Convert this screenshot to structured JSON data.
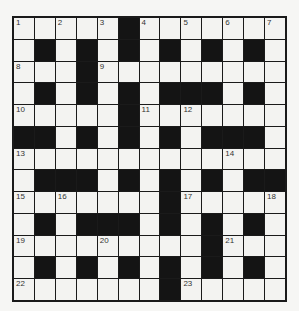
{
  "puzzle": {
    "rows": 13,
    "cols": 13,
    "pattern": [
      "WWWWWBWWWWWWW",
      "WBWBWBWBWBWBW",
      "WWWBWWWWWWWWW",
      "WBWBWBWBBBWBW",
      "WWWWWBWWWWWWW",
      "BBWBWBWBWBBBW",
      "WWWWWWWWWWWWW",
      "WBBBWBWBWBWBB",
      "WWWWWWWBWWWWW",
      "WBWBBBWBWBWBW",
      "WWWWWWWWWBWWW",
      "WBWBWBWBWBWBW",
      "WWWWWWWBWWWWW"
    ],
    "numbers": [
      {
        "r": 0,
        "c": 0,
        "n": "1"
      },
      {
        "r": 0,
        "c": 2,
        "n": "2"
      },
      {
        "r": 0,
        "c": 4,
        "n": "3"
      },
      {
        "r": 0,
        "c": 6,
        "n": "4"
      },
      {
        "r": 0,
        "c": 8,
        "n": "5"
      },
      {
        "r": 0,
        "c": 10,
        "n": "6"
      },
      {
        "r": 0,
        "c": 12,
        "n": "7"
      },
      {
        "r": 2,
        "c": 0,
        "n": "8"
      },
      {
        "r": 2,
        "c": 4,
        "n": "9"
      },
      {
        "r": 4,
        "c": 0,
        "n": "10"
      },
      {
        "r": 4,
        "c": 6,
        "n": "11"
      },
      {
        "r": 4,
        "c": 8,
        "n": "12"
      },
      {
        "r": 6,
        "c": 0,
        "n": "13"
      },
      {
        "r": 6,
        "c": 10,
        "n": "14"
      },
      {
        "r": 8,
        "c": 0,
        "n": "15"
      },
      {
        "r": 8,
        "c": 2,
        "n": "16"
      },
      {
        "r": 8,
        "c": 8,
        "n": "17"
      },
      {
        "r": 8,
        "c": 12,
        "n": "18"
      },
      {
        "r": 10,
        "c": 0,
        "n": "19"
      },
      {
        "r": 10,
        "c": 4,
        "n": "20"
      },
      {
        "r": 10,
        "c": 10,
        "n": "21"
      },
      {
        "r": 12,
        "c": 0,
        "n": "22"
      },
      {
        "r": 12,
        "c": 8,
        "n": "23"
      }
    ]
  },
  "colors": {
    "background": "#f6f6f4",
    "white_cell": "#f3f3f1",
    "black_cell": "#141414",
    "grid_line": "#1a1a1a"
  }
}
